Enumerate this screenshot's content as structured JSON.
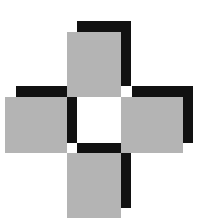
{
  "diagram": {
    "type": "cross-of-squares",
    "colors": {
      "tile": "#b4b4b4",
      "shadow": "#111111",
      "background": "#ffffff"
    },
    "shadow_offset": {
      "dx": 10,
      "dy": -11
    },
    "tiles": [
      {
        "name": "top",
        "x": 67,
        "y": 32,
        "w": 54,
        "h": 65
      },
      {
        "name": "left",
        "x": 5,
        "y": 97,
        "w": 62,
        "h": 56
      },
      {
        "name": "right",
        "x": 121,
        "y": 97,
        "w": 62,
        "h": 56
      },
      {
        "name": "bottom",
        "x": 67,
        "y": 153,
        "w": 54,
        "h": 65
      }
    ]
  }
}
